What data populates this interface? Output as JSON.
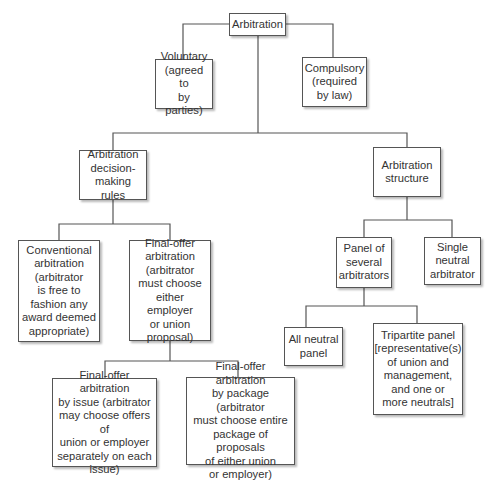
{
  "diagram": {
    "type": "tree",
    "colors": {
      "line": "#555555",
      "box_border": "#555555",
      "text": "#333333",
      "background": "#ffffff"
    },
    "nodes": {
      "root": {
        "label": "Arbitration"
      },
      "voluntary": {
        "label": "Voluntary\n(agreed to\nby parties)"
      },
      "compulsory": {
        "label": "Compulsory\n(required\nby law)"
      },
      "decision_rules": {
        "label": "Arbitration\ndecision-\nmaking rules"
      },
      "structure": {
        "label": "Arbitration\nstructure"
      },
      "conventional": {
        "label": "Conventional\narbitration\n(arbitrator\nis free to\nfashion any\naward deemed\nappropriate)"
      },
      "final_offer": {
        "label": "Final-offer\narbitration\n(arbitrator\nmust choose\neither employer\nor union\nproposal)"
      },
      "panel": {
        "label": "Panel of\nseveral\narbitrators"
      },
      "single_neutral": {
        "label": "Single\nneutral\narbitrator"
      },
      "all_neutral": {
        "label": "All neutral\npanel"
      },
      "tripartite": {
        "label": "Tripartite panel\n[representative(s)\nof union and\nmanagement,\nand one or\nmore neutrals]"
      },
      "by_issue": {
        "label": "Final-offer arbitration\nby issue (arbitrator\nmay choose offers of\nunion or employer\nseparately on each\nissue)"
      },
      "by_package": {
        "label": "Final-offer arbitration\nby package (arbitrator\nmust choose entire\npackage of proposals\nof either union\nor employer)"
      }
    },
    "edges": [
      [
        "root",
        "voluntary"
      ],
      [
        "root",
        "compulsory"
      ],
      [
        "root",
        "decision_rules"
      ],
      [
        "root",
        "structure"
      ],
      [
        "decision_rules",
        "conventional"
      ],
      [
        "decision_rules",
        "final_offer"
      ],
      [
        "final_offer",
        "by_issue"
      ],
      [
        "final_offer",
        "by_package"
      ],
      [
        "structure",
        "panel"
      ],
      [
        "structure",
        "single_neutral"
      ],
      [
        "panel",
        "all_neutral"
      ],
      [
        "panel",
        "tripartite"
      ]
    ]
  }
}
